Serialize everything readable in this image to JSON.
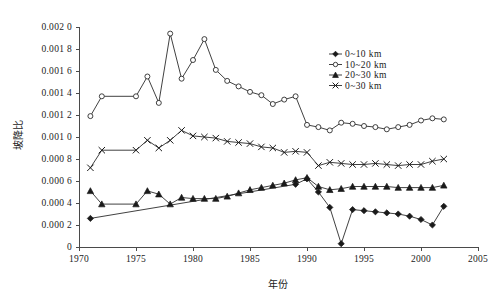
{
  "chart_data": {
    "type": "line",
    "title": "",
    "xlabel": "年份",
    "ylabel": "坡降比",
    "xlim": [
      1970,
      2005
    ],
    "ylim": [
      0,
      0.002
    ],
    "grid": false,
    "legend_position": "top-right",
    "xticks": [
      "1970",
      "1975",
      "1980",
      "1985",
      "1990",
      "1995",
      "2000",
      "2005"
    ],
    "xtick_values": [
      1970,
      1975,
      1980,
      1985,
      1990,
      1995,
      2000,
      2005
    ],
    "yticks": [
      "0",
      "0.000 2",
      "0.000 4",
      "0.000 6",
      "0.000 8",
      "0.001 0",
      "0.001 2",
      "0.001 4",
      "0.001 6",
      "0.001 8",
      "0.002 0"
    ],
    "ytick_values": [
      0,
      0.0002,
      0.0004,
      0.0006,
      0.0008,
      0.001,
      0.0012,
      0.0014,
      0.0016,
      0.0018,
      0.002
    ],
    "series": [
      {
        "name": "0~10 km",
        "marker": "diamond",
        "x": [
          1971,
          1989,
          1990,
          1991,
          1992,
          1993,
          1994,
          1995,
          1996,
          1997,
          1998,
          1999,
          2000,
          2001,
          2002
        ],
        "values": [
          0.00026,
          0.00057,
          0.00062,
          0.0005,
          0.00036,
          3e-05,
          0.00034,
          0.00033,
          0.00032,
          0.00031,
          0.0003,
          0.00028,
          0.00025,
          0.0002,
          0.00037
        ]
      },
      {
        "name": "10~20 km",
        "marker": "circle",
        "x": [
          1971,
          1972,
          1975,
          1976,
          1977,
          1978,
          1979,
          1980,
          1981,
          1982,
          1983,
          1984,
          1985,
          1986,
          1987,
          1988,
          1989,
          1990,
          1991,
          1992,
          1993,
          1994,
          1995,
          1996,
          1997,
          1998,
          1999,
          2000,
          2001,
          2002
        ],
        "values": [
          0.00119,
          0.00137,
          0.00137,
          0.00155,
          0.00131,
          0.00194,
          0.00153,
          0.0017,
          0.00189,
          0.00161,
          0.00151,
          0.00146,
          0.00141,
          0.00138,
          0.0013,
          0.00134,
          0.00137,
          0.00111,
          0.00109,
          0.00106,
          0.00113,
          0.00112,
          0.0011,
          0.00109,
          0.00107,
          0.00109,
          0.00111,
          0.00115,
          0.00117,
          0.00116
        ]
      },
      {
        "name": "20~30 km",
        "marker": "triangle",
        "x": [
          1971,
          1972,
          1975,
          1976,
          1977,
          1978,
          1979,
          1980,
          1981,
          1982,
          1983,
          1984,
          1985,
          1986,
          1987,
          1988,
          1989,
          1990,
          1991,
          1992,
          1993,
          1994,
          1995,
          1996,
          1997,
          1998,
          1999,
          2000,
          2001,
          2002
        ],
        "values": [
          0.00051,
          0.00039,
          0.00039,
          0.00051,
          0.00048,
          0.00039,
          0.00045,
          0.00044,
          0.00044,
          0.00044,
          0.00046,
          0.00049,
          0.00052,
          0.00054,
          0.00056,
          0.00058,
          0.00061,
          0.00063,
          0.00055,
          0.00052,
          0.00053,
          0.00055,
          0.00055,
          0.00055,
          0.00055,
          0.00054,
          0.00054,
          0.00054,
          0.00054,
          0.00056
        ]
      },
      {
        "name": "0~30 km",
        "marker": "x",
        "x": [
          1971,
          1972,
          1975,
          1976,
          1977,
          1978,
          1979,
          1980,
          1981,
          1982,
          1983,
          1984,
          1985,
          1986,
          1987,
          1988,
          1989,
          1990,
          1991,
          1992,
          1993,
          1994,
          1995,
          1996,
          1997,
          1998,
          1999,
          2000,
          2001,
          2002
        ],
        "values": [
          0.00072,
          0.00088,
          0.00088,
          0.00097,
          0.0009,
          0.00097,
          0.00106,
          0.00101,
          0.001,
          0.00099,
          0.00096,
          0.00095,
          0.00094,
          0.00091,
          0.0009,
          0.00086,
          0.00087,
          0.00086,
          0.00074,
          0.00077,
          0.00076,
          0.00075,
          0.00075,
          0.00076,
          0.00075,
          0.00074,
          0.00075,
          0.00075,
          0.00078,
          0.0008
        ]
      }
    ]
  },
  "legend": {
    "items": [
      {
        "label": "0~10 km",
        "marker": "diamond"
      },
      {
        "label": "10~20 km",
        "marker": "circle"
      },
      {
        "label": "20~30 km",
        "marker": "triangle"
      },
      {
        "label": "0~30 km",
        "marker": "x"
      }
    ]
  }
}
